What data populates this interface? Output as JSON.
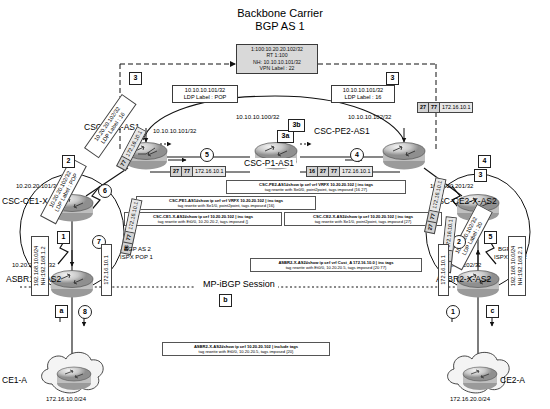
{
  "diagram": {
    "title_line1": "Backbone Carrier",
    "title_line2": "BGP AS 1"
  },
  "vpn_box": {
    "line1": "1:100:10.20.20.102/32",
    "line2": "RT 1:100",
    "line3": "NH: 10.10.10.101/32",
    "line4": "VPN Label : 22"
  },
  "ldp_boxes": {
    "left": {
      "line1": "10.10.10.101/32",
      "line2": "LDP Label : POP"
    },
    "right": {
      "line1": "10.10.10.101/32",
      "line2": "LDP Label : 16"
    }
  },
  "routers": {
    "csc_pe1": "CSC-PE1-AS1",
    "csc_p1": "CSC-P1-AS1",
    "csc_pe2": "CSC-PE2-AS1",
    "csc_ce1": "CSC-CE1-X-AS2",
    "csc_ce2": "CSC-CE2-X-AS2",
    "asbr1": "ASBR1-X-AS2",
    "asbr2": "ASBR2-X-AS2",
    "ce1": "CE1-A",
    "ce2": "CE2-A"
  },
  "loopbacks": {
    "pe1": "10.10.10.101/32",
    "p1": "10.10.10.100/32",
    "pe2": "10.10.10.102/32",
    "ce1": "10.20.20.101/32",
    "ce2": "10.20.20.201/32",
    "asbr1": "10.20.20.102/32",
    "asbr2": "10.20.20.202/32"
  },
  "as_labels": {
    "left_as": "BGP AS 2",
    "left_pop": "ISPX POP 1",
    "right_as": "BGP AS 2",
    "right_pop": "ISPX POP 2"
  },
  "ldp_diag": {
    "pe1": {
      "line1": "10.20.20.102/32",
      "line2": "LDP Label : 16"
    },
    "ce1": {
      "line1": "10.20.20.102/32",
      "line2": "LDP Label : POP"
    },
    "ce2": {
      "line1": "10.20.20.102/32",
      "line2": "LDP Label : 20"
    }
  },
  "stacks": {
    "pe1_out": [
      "27",
      "77",
      "172.16.10.1"
    ],
    "p1_left": [
      "27",
      "77",
      "172.16.10.1"
    ],
    "p1_right": [
      "16",
      "27",
      "77",
      "172.16.10.1"
    ],
    "pe2_out": [
      "27",
      "77",
      "172.16.10.1"
    ],
    "ce1_vert": [
      "77",
      "172.16.10.1"
    ],
    "pe1_vert": [
      "16",
      "77",
      "172.16.10.1"
    ],
    "pe2_vert": [
      "27",
      "77",
      "172.16.10.1"
    ],
    "ce2_vert": [
      "20",
      "77",
      "172.16.10.1"
    ]
  },
  "commands": {
    "csc_pe2": {
      "line1": "CSC-PE2-AS1#show ip cef vrf VRFX 10.20.20.102 | inc tags",
      "line2": "tag rewrite with Se0/0, point2point, tags imposed {16 27}"
    },
    "csc_pe1": {
      "line1": "CSC-PE1-AS1#show ip cef vrf VRFX 10.20.20.102 | inc tags",
      "line2": "tag rewrite with Se1/0, point2point, tags imposed {16}"
    },
    "csc_ce1": {
      "line1": "CSC-CE1-X-AS2#show ip cef 10.20.20.102 | inc tags",
      "line2": "tag rewrite with Et0/0, 10.20.20.2, tags imposed {}"
    },
    "csc_ce2": {
      "line1": "CSC-CE2-X-AS2#show ip cef 10.20.20.102 | inc tags",
      "line2": "tag rewrite with Se1/0, point2point, tags imposed {27}"
    },
    "asbr2": {
      "line1": "ASBR2-X-AS2#show ip cef vrf Cust_A 172.16.10.0 | inc tags",
      "line2": "tag rewrite with Et0/0, 10.20.20.5, tags imposed {20 77}"
    },
    "asbr3": {
      "line1": "ASBR2-X-AS2#show ip cef 10.20.20.102 | include tags",
      "line2": "tag rewrite with Et0/0, 10.20.20.5, tags imposed {20}"
    }
  },
  "mpibgp": {
    "label": "MP-iBGP Session",
    "marker": "b"
  },
  "bottom": {
    "ce1_net": "172.16.10.0/24",
    "ce2_net": "172.16.20.0/24",
    "left_nh": {
      "line1": "192.168.10.0/24",
      "line2": "NH:192.168.1.2"
    },
    "right_nh": {
      "line1": "192.168.10.0/24",
      "line2": "NH:192.168.2.1"
    },
    "left_prefix": "172.16.10.1",
    "right_prefix": "172.16.10.1",
    "left_marker_sq": "a",
    "left_marker_ci": "8",
    "right_marker_ci": "1",
    "right_marker_sq": "c"
  },
  "asbr1_side": {
    "line1": "172.16.10.0/24",
    "line2": "NH:10.20.20.102"
  },
  "steps": {
    "s1": "1",
    "s2": "2",
    "s3": "3",
    "s4": "4",
    "s5": "5",
    "s6": "6",
    "s7": "7",
    "s8": "8",
    "s3_top_left": "3",
    "s3_top_right": "3",
    "s3a": "3a",
    "s3b": "3b",
    "c4": "4",
    "c5": "5",
    "c2": "2",
    "c1": "1"
  }
}
